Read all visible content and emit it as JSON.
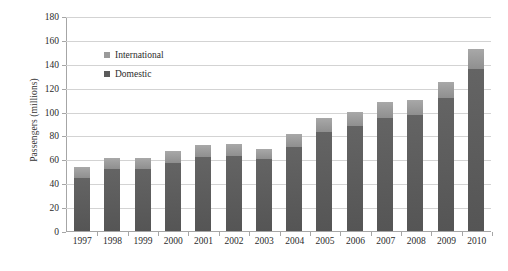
{
  "chart_data": {
    "type": "bar",
    "subtype": "stacked-column",
    "title": "",
    "xlabel": "",
    "ylabel": "Passengers (millions)",
    "ylim": [
      0,
      180
    ],
    "ytick_step": 20,
    "yticks": [
      180,
      160,
      140,
      120,
      100,
      80,
      60,
      40,
      20,
      0
    ],
    "grid": true,
    "legend_position": "inside-upper-left",
    "categories": [
      "1997",
      "1998",
      "1999",
      "2000",
      "2001",
      "2002",
      "2003",
      "2004",
      "2005",
      "2006",
      "2007",
      "2008",
      "2009",
      "2010"
    ],
    "series": [
      {
        "name": "Domestic",
        "color": "#5b5b5b",
        "values": [
          44,
          52,
          52,
          57,
          62,
          63,
          60,
          70,
          83,
          88,
          95,
          97,
          111,
          136
        ]
      },
      {
        "name": "International",
        "color": "#9a9a9a",
        "values": [
          10,
          9,
          9,
          10,
          10,
          10,
          9,
          11,
          12,
          12,
          13,
          13,
          14,
          16
        ]
      }
    ],
    "totals": [
      54,
      61,
      61,
      67,
      72,
      73,
      69,
      81,
      95,
      100,
      108,
      110,
      125,
      152
    ]
  },
  "legend": {
    "entries": [
      {
        "label": "International",
        "color": "#9a9a9a"
      },
      {
        "label": "Domestic",
        "color": "#5b5b5b"
      }
    ]
  },
  "axis": {
    "y_title": "Passengers (millions)"
  }
}
